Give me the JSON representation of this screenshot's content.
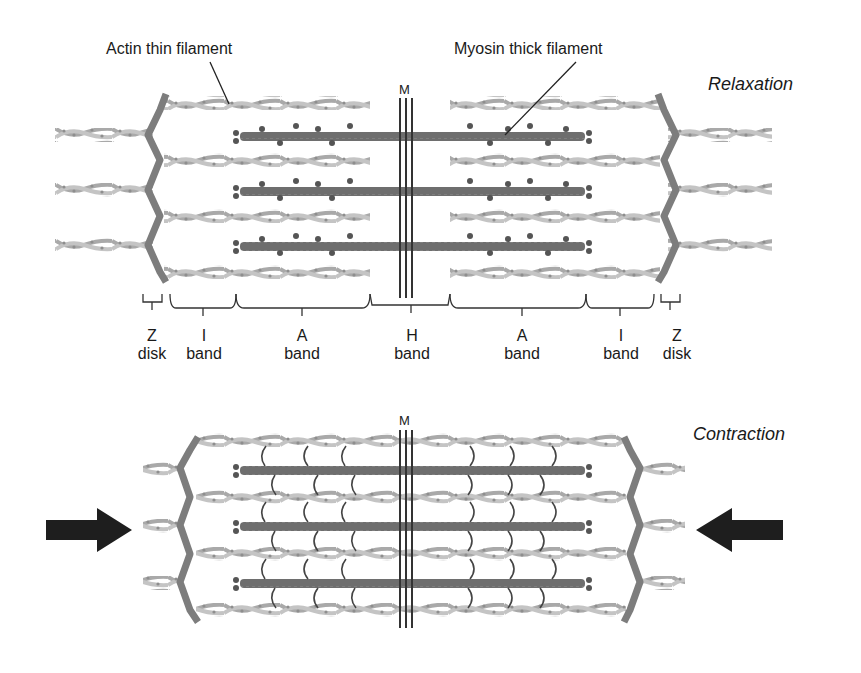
{
  "figure": {
    "colors": {
      "actin": "#b8b8b8",
      "actin_dots": "#8e8e8e",
      "myosin": "#6e6e6e",
      "myosin_heads": "#555555",
      "z_disk": "#7d7d7d",
      "m_line": "#333333",
      "arrow": "#1e1e1e",
      "text": "#1a1a1a"
    }
  },
  "relaxation": {
    "state_label": "Relaxation",
    "callouts": {
      "actin": "Actin thin filament",
      "myosin": "Myosin thick filament"
    },
    "m_label": "M",
    "bands": [
      {
        "letter": "Z",
        "name": "disk"
      },
      {
        "letter": "I",
        "name": "band"
      },
      {
        "letter": "A",
        "name": "band"
      },
      {
        "letter": "H",
        "name": "band"
      },
      {
        "letter": "A",
        "name": "band"
      },
      {
        "letter": "I",
        "name": "band"
      },
      {
        "letter": "Z",
        "name": "disk"
      }
    ]
  },
  "contraction": {
    "state_label": "Contraction",
    "m_label": "M",
    "arrows": [
      {
        "direction": "right",
        "meaning": "inward force from left"
      },
      {
        "direction": "left",
        "meaning": "inward force from right"
      }
    ]
  }
}
